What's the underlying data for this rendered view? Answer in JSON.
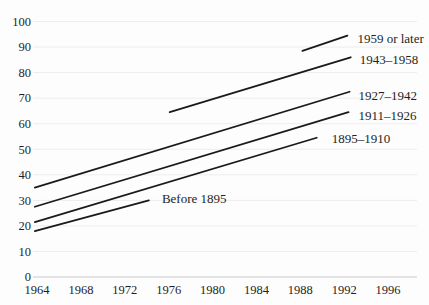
{
  "figure": {
    "kind": "scanned-book-line-chart",
    "background_color": "#fdfdfd",
    "line_color": "#1a1a1a",
    "grid_color": "#ededed",
    "axis_line_color": "#c9c9c9",
    "text_color": "#1f1f1f"
  },
  "chart_data": {
    "type": "line",
    "title": "",
    "xlabel": "",
    "ylabel": "",
    "xlim": [
      1964,
      1998.5
    ],
    "ylim": [
      0,
      100
    ],
    "x_ticks": [
      1964,
      1968,
      1972,
      1976,
      1980,
      1984,
      1988,
      1992,
      1996
    ],
    "y_ticks": [
      0,
      10,
      20,
      30,
      40,
      50,
      60,
      70,
      80,
      90,
      100
    ],
    "grid": "horizontal-faint",
    "legend_position": "inline-at-line-end",
    "series": [
      {
        "name": "1959 or later",
        "x": [
          1988.2,
          1992.3
        ],
        "y": [
          88.5,
          94.5
        ],
        "label_dx": 10,
        "label_dy": 3
      },
      {
        "name": "1943–1958",
        "x": [
          1976.1,
          1992.6
        ],
        "y": [
          64.5,
          86.0
        ],
        "label_dx": 9,
        "label_dy": 2
      },
      {
        "name": "1927–1942",
        "x": [
          1963.8,
          1992.5
        ],
        "y": [
          35.0,
          72.5
        ],
        "label_dx": 9,
        "label_dy": 4
      },
      {
        "name": "1911–1926",
        "x": [
          1963.8,
          1992.4
        ],
        "y": [
          27.5,
          64.5
        ],
        "label_dx": 10,
        "label_dy": 3
      },
      {
        "name": "1895–1910",
        "x": [
          1963.8,
          1989.5
        ],
        "y": [
          21.5,
          54.5
        ],
        "label_dx": 15,
        "label_dy": 1
      },
      {
        "name": "Before 1895",
        "x": [
          1963.8,
          1974.2
        ],
        "y": [
          18.0,
          30.0
        ],
        "label_dx": 13,
        "label_dy": -2
      }
    ]
  }
}
